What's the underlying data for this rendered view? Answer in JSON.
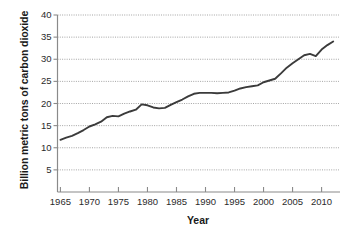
{
  "chart_data": {
    "type": "line",
    "title": "",
    "xlabel": "Year",
    "ylabel": "Billion metric tons of carbon dioxide",
    "xlim": [
      1964.5,
      2013.0
    ],
    "ylim": [
      0,
      40
    ],
    "grid": true,
    "grid_style": "dotted-horizontal",
    "legend": "none",
    "yticks": [
      5,
      10,
      15,
      20,
      25,
      30,
      35,
      40
    ],
    "ytick_labels": [
      "5",
      "10",
      "15",
      "20",
      "25",
      "30",
      "35",
      "40"
    ],
    "xticks": [
      1965,
      1970,
      1975,
      1980,
      1985,
      1990,
      1995,
      2000,
      2005,
      2010
    ],
    "xtick_labels": [
      "1965",
      "1970",
      "1975",
      "1980",
      "1985",
      "1990",
      "1995",
      "2000",
      "2005",
      "2010"
    ],
    "series": [
      {
        "name": "Global CO2 emissions",
        "color": "#3b3b3b",
        "x": [
          1965,
          1966,
          1967,
          1968,
          1969,
          1970,
          1971,
          1972,
          1973,
          1974,
          1975,
          1976,
          1977,
          1978,
          1979,
          1980,
          1981,
          1982,
          1983,
          1984,
          1985,
          1986,
          1987,
          1988,
          1989,
          1990,
          1991,
          1992,
          1993,
          1994,
          1995,
          1996,
          1997,
          1998,
          1999,
          2000,
          2001,
          2002,
          2003,
          2004,
          2005,
          2006,
          2007,
          2008,
          2009,
          2010,
          2011,
          2012
        ],
        "values": [
          11.8,
          12.3,
          12.7,
          13.3,
          14.0,
          14.8,
          15.3,
          15.9,
          16.9,
          17.2,
          17.1,
          17.7,
          18.2,
          18.6,
          19.8,
          19.6,
          19.1,
          18.9,
          19.0,
          19.7,
          20.3,
          20.9,
          21.6,
          22.2,
          22.4,
          22.4,
          22.4,
          22.3,
          22.4,
          22.5,
          22.9,
          23.4,
          23.7,
          23.9,
          24.1,
          24.8,
          25.2,
          25.6,
          26.8,
          28.1,
          29.1,
          30.0,
          30.9,
          31.2,
          30.7,
          32.2,
          33.2,
          34.0
        ]
      }
    ]
  },
  "axis": {
    "x_title": "Year",
    "y_title": "Billion metric tons of carbon dioxide"
  }
}
